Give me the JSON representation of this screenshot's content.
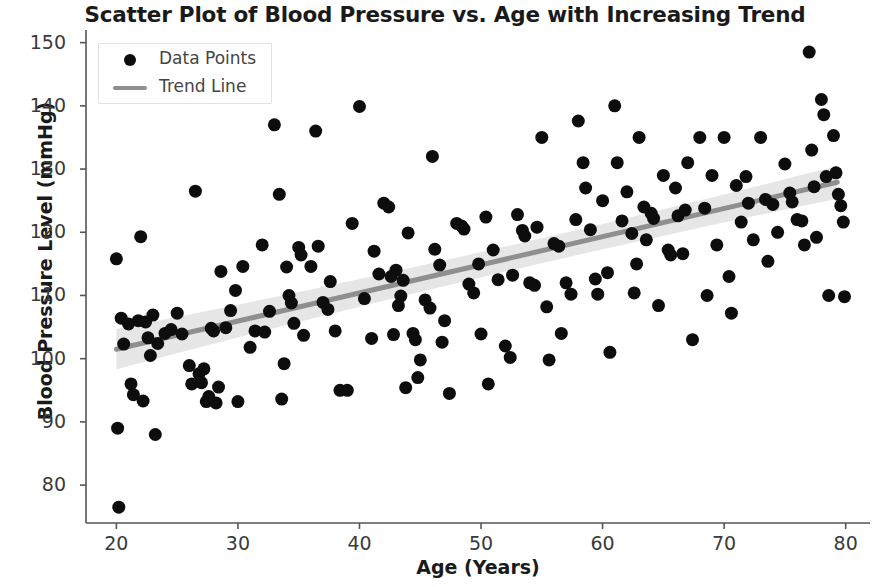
{
  "chart_data": {
    "type": "scatter",
    "title": "Scatter Plot of Blood Pressure vs. Age with Increasing Trend",
    "xlabel": "Age (Years)",
    "ylabel": "Blood Pressure Level (mmHg)",
    "xlim": [
      17.5,
      82
    ],
    "ylim": [
      74,
      152
    ],
    "xticks": [
      20,
      30,
      40,
      50,
      60,
      70,
      80
    ],
    "yticks": [
      80,
      90,
      100,
      110,
      120,
      130,
      140,
      150
    ],
    "grid": false,
    "legend": {
      "position": "upper left",
      "entries": [
        {
          "label": "Data Points",
          "marker": "circle",
          "color": "#0d0d0d"
        },
        {
          "label": "Trend Line",
          "marker": "line",
          "color": "#8f8f8f"
        }
      ]
    },
    "series": [
      {
        "name": "Data Points",
        "marker_color": "#0d0d0d",
        "marker_size": 13,
        "points": [
          [
            20.0,
            115.8
          ],
          [
            20.1,
            89.0
          ],
          [
            20.2,
            76.5
          ],
          [
            20.4,
            106.4
          ],
          [
            20.6,
            102.3
          ],
          [
            21.0,
            105.5
          ],
          [
            21.2,
            96.0
          ],
          [
            21.4,
            94.3
          ],
          [
            21.8,
            106.0
          ],
          [
            22.0,
            119.3
          ],
          [
            22.2,
            93.3
          ],
          [
            22.4,
            105.8
          ],
          [
            22.6,
            103.3
          ],
          [
            23.0,
            106.9
          ],
          [
            23.2,
            88.0
          ],
          [
            23.4,
            102.4
          ],
          [
            24.0,
            104.0
          ],
          [
            24.5,
            104.6
          ],
          [
            25.4,
            103.9
          ],
          [
            26.0,
            98.9
          ],
          [
            26.2,
            96.0
          ],
          [
            26.5,
            126.5
          ],
          [
            26.8,
            97.6
          ],
          [
            27.0,
            96.2
          ],
          [
            27.2,
            98.4
          ],
          [
            27.4,
            93.2
          ],
          [
            27.6,
            94.0
          ],
          [
            27.8,
            104.8
          ],
          [
            28.0,
            104.4
          ],
          [
            28.2,
            93.0
          ],
          [
            28.4,
            95.5
          ],
          [
            28.6,
            113.8
          ],
          [
            29.0,
            104.9
          ],
          [
            29.4,
            107.6
          ],
          [
            30.0,
            93.2
          ],
          [
            30.4,
            114.6
          ],
          [
            31.0,
            101.8
          ],
          [
            31.4,
            104.4
          ],
          [
            32.0,
            118.0
          ],
          [
            32.2,
            104.2
          ],
          [
            32.6,
            107.5
          ],
          [
            33.0,
            137.0
          ],
          [
            33.4,
            126.0
          ],
          [
            33.6,
            93.6
          ],
          [
            34.0,
            114.5
          ],
          [
            34.2,
            110.0
          ],
          [
            34.4,
            108.8
          ],
          [
            34.6,
            105.6
          ],
          [
            35.0,
            117.6
          ],
          [
            35.2,
            116.4
          ],
          [
            35.4,
            103.7
          ],
          [
            36.0,
            114.6
          ],
          [
            36.4,
            136.0
          ],
          [
            36.6,
            117.8
          ],
          [
            37.0,
            108.9
          ],
          [
            37.4,
            107.8
          ],
          [
            38.0,
            104.4
          ],
          [
            38.4,
            95.0
          ],
          [
            39.0,
            95.0
          ],
          [
            39.4,
            121.4
          ],
          [
            40.0,
            139.9
          ],
          [
            40.4,
            109.5
          ],
          [
            41.0,
            103.2
          ],
          [
            41.6,
            113.4
          ],
          [
            42.0,
            124.6
          ],
          [
            42.4,
            124.0
          ],
          [
            42.6,
            113.0
          ],
          [
            43.0,
            114.0
          ],
          [
            43.2,
            108.4
          ],
          [
            43.4,
            109.9
          ],
          [
            43.6,
            112.4
          ],
          [
            44.0,
            119.9
          ],
          [
            44.4,
            104.0
          ],
          [
            44.6,
            103.0
          ],
          [
            45.0,
            99.8
          ],
          [
            45.4,
            109.3
          ],
          [
            46.0,
            132.0
          ],
          [
            46.2,
            117.3
          ],
          [
            46.6,
            114.8
          ],
          [
            47.0,
            106.0
          ],
          [
            47.4,
            94.5
          ],
          [
            48.0,
            121.4
          ],
          [
            48.4,
            121.0
          ],
          [
            48.6,
            120.5
          ],
          [
            49.0,
            111.8
          ],
          [
            49.4,
            110.4
          ],
          [
            50.0,
            103.9
          ],
          [
            50.4,
            122.4
          ],
          [
            50.6,
            96.0
          ],
          [
            51.0,
            117.2
          ],
          [
            51.4,
            112.5
          ],
          [
            52.0,
            102.0
          ],
          [
            52.4,
            100.2
          ],
          [
            53.0,
            122.8
          ],
          [
            53.4,
            120.3
          ],
          [
            53.6,
            119.4
          ],
          [
            54.0,
            112.0
          ],
          [
            54.4,
            111.6
          ],
          [
            55.0,
            135.0
          ],
          [
            55.4,
            108.2
          ],
          [
            55.6,
            99.8
          ],
          [
            56.0,
            118.2
          ],
          [
            56.4,
            117.8
          ],
          [
            57.0,
            112.0
          ],
          [
            57.4,
            110.2
          ],
          [
            58.0,
            137.6
          ],
          [
            58.4,
            131.0
          ],
          [
            58.6,
            127.0
          ],
          [
            59.0,
            120.4
          ],
          [
            59.4,
            112.6
          ],
          [
            59.6,
            110.2
          ],
          [
            60.0,
            125.0
          ],
          [
            60.4,
            113.6
          ],
          [
            60.6,
            101.0
          ],
          [
            61.0,
            140.0
          ],
          [
            61.2,
            131.0
          ],
          [
            61.6,
            121.8
          ],
          [
            62.0,
            126.4
          ],
          [
            62.4,
            119.8
          ],
          [
            62.6,
            110.4
          ],
          [
            63.0,
            135.0
          ],
          [
            63.4,
            124.0
          ],
          [
            63.6,
            118.8
          ],
          [
            64.0,
            123.0
          ],
          [
            64.2,
            122.2
          ],
          [
            64.6,
            108.4
          ],
          [
            65.0,
            129.0
          ],
          [
            65.4,
            117.2
          ],
          [
            65.6,
            116.4
          ],
          [
            66.0,
            127.0
          ],
          [
            66.2,
            122.6
          ],
          [
            66.6,
            116.6
          ],
          [
            67.0,
            131.0
          ],
          [
            67.4,
            103.0
          ],
          [
            68.0,
            135.0
          ],
          [
            68.4,
            123.8
          ],
          [
            68.6,
            110.0
          ],
          [
            69.0,
            129.0
          ],
          [
            69.4,
            118.0
          ],
          [
            70.0,
            135.0
          ],
          [
            70.4,
            113.0
          ],
          [
            70.6,
            107.2
          ],
          [
            71.0,
            127.4
          ],
          [
            71.4,
            121.6
          ],
          [
            72.0,
            124.6
          ],
          [
            72.4,
            118.8
          ],
          [
            73.0,
            135.0
          ],
          [
            73.4,
            125.2
          ],
          [
            73.6,
            115.4
          ],
          [
            74.0,
            124.4
          ],
          [
            74.4,
            120.0
          ],
          [
            75.0,
            130.8
          ],
          [
            75.4,
            126.2
          ],
          [
            76.0,
            122.0
          ],
          [
            76.4,
            121.8
          ],
          [
            76.6,
            118.0
          ],
          [
            77.0,
            148.5
          ],
          [
            77.2,
            133.0
          ],
          [
            77.4,
            127.2
          ],
          [
            77.6,
            119.2
          ],
          [
            78.0,
            141.0
          ],
          [
            78.2,
            138.6
          ],
          [
            78.4,
            128.8
          ],
          [
            78.6,
            110.0
          ],
          [
            79.0,
            135.3
          ],
          [
            79.2,
            129.4
          ],
          [
            79.4,
            126.0
          ],
          [
            79.6,
            124.2
          ],
          [
            79.8,
            121.6
          ],
          [
            79.9,
            109.8
          ],
          [
            22.8,
            100.5
          ],
          [
            25.0,
            107.2
          ],
          [
            29.8,
            110.8
          ],
          [
            33.8,
            99.2
          ],
          [
            37.6,
            112.2
          ],
          [
            41.2,
            117.0
          ],
          [
            45.8,
            108.0
          ],
          [
            49.8,
            115.0
          ],
          [
            54.6,
            120.8
          ],
          [
            57.8,
            122.0
          ],
          [
            62.8,
            115.0
          ],
          [
            66.8,
            123.5
          ],
          [
            71.8,
            128.8
          ],
          [
            75.6,
            124.8
          ],
          [
            44.8,
            97.0
          ],
          [
            43.8,
            95.4
          ],
          [
            42.8,
            103.8
          ],
          [
            46.8,
            102.6
          ],
          [
            52.6,
            113.2
          ],
          [
            56.6,
            104.0
          ]
        ]
      }
    ],
    "trend_line": {
      "name": "Trend Line",
      "color": "#8f8f8f",
      "width": 5,
      "x_start": 20.0,
      "y_start": 101.5,
      "x_end": 79.3,
      "y_end": 127.9,
      "confidence_band": {
        "color": "#d9d9d9",
        "half_width_start": 3.2,
        "half_width_mid": 1.1,
        "half_width_end": 2.6
      }
    }
  },
  "axes": {
    "spine_color": "#555555",
    "tick_color": "#555555",
    "background": "#ffffff"
  }
}
